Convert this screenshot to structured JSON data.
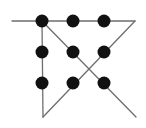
{
  "diagram": {
    "title": "",
    "colors": {
      "background": "#ffffff",
      "dot": "#111111",
      "line": "#6e6e6e"
    },
    "dot_radius": 6.5,
    "dots": [
      {
        "row": 0,
        "col": 0,
        "x": 42,
        "y": 21
      },
      {
        "row": 0,
        "col": 1,
        "x": 73,
        "y": 21
      },
      {
        "row": 0,
        "col": 2,
        "x": 104,
        "y": 21
      },
      {
        "row": 1,
        "col": 0,
        "x": 42,
        "y": 52
      },
      {
        "row": 1,
        "col": 1,
        "x": 73,
        "y": 52
      },
      {
        "row": 1,
        "col": 2,
        "x": 104,
        "y": 52
      },
      {
        "row": 2,
        "col": 0,
        "x": 42,
        "y": 83
      },
      {
        "row": 2,
        "col": 1,
        "x": 73,
        "y": 83
      },
      {
        "row": 2,
        "col": 2,
        "x": 104,
        "y": 83
      }
    ],
    "path": [
      {
        "x": 136,
        "y": 117
      },
      {
        "x": 42,
        "y": 21
      },
      {
        "x": 12,
        "y": 21
      },
      {
        "x": 135,
        "y": 21
      },
      {
        "x": 43,
        "y": 117
      },
      {
        "x": 42,
        "y": 21
      }
    ],
    "segments": [
      {
        "name": "top-horizontal-line",
        "x1": 12,
        "y1": 21,
        "x2": 135,
        "y2": 21
      },
      {
        "name": "descending-diagonal-line",
        "x1": 42,
        "y1": 21,
        "x2": 136,
        "y2": 117
      },
      {
        "name": "left-vertical-line",
        "x1": 42,
        "y1": 21,
        "x2": 43,
        "y2": 117
      },
      {
        "name": "ascending-diagonal-line",
        "x1": 43,
        "y1": 117,
        "x2": 135,
        "y2": 21
      }
    ]
  }
}
